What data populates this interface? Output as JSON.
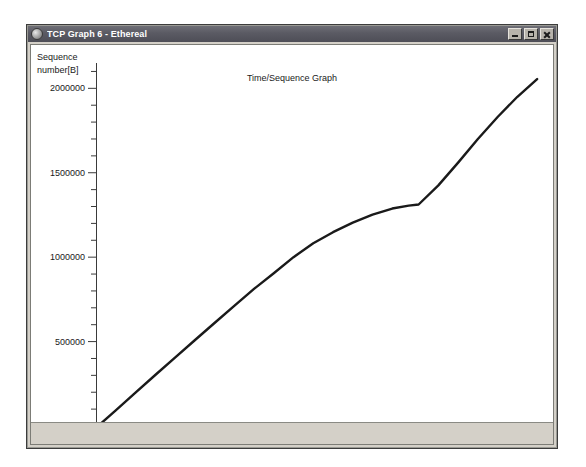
{
  "window": {
    "title": "TCP Graph 6 - Ethereal",
    "icon": "app-globe-icon",
    "buttons": {
      "minimize": "Minimize",
      "maximize": "Maximize",
      "close": "Close"
    }
  },
  "chart_data": {
    "type": "line",
    "title": "Time/Sequence Graph",
    "xlabel": "",
    "ylabel": "Sequence number[B]",
    "ylabel_line1": "Sequence",
    "ylabel_line2": "number[B]",
    "xlim": [
      0,
      6.85
    ],
    "ylim": [
      0,
      2150000
    ],
    "grid": false,
    "legend": "none",
    "xticks": [
      0.5,
      1.0,
      1.5,
      2.0,
      2.5,
      3.0,
      3.5,
      4.0,
      4.5,
      5.0,
      5.5,
      6.0,
      6.5
    ],
    "xticklabels": [
      "0.5",
      "1.0",
      "1.5",
      "2.0",
      "2.5",
      "3.0",
      "3.5",
      "4.0",
      "4.5",
      "5.0",
      "5.5",
      "6.0",
      "6.5"
    ],
    "xtick_minor_step": 0.1,
    "yticks": [
      500000,
      1000000,
      1500000,
      2000000
    ],
    "yticklabels": [
      "500000",
      "1000000",
      "1500000",
      "2000000"
    ],
    "ytick_minor_step": 100000,
    "series": [
      {
        "name": "tcp-sequence",
        "color": "#1a1a1a",
        "x": [
          0.06,
          0.3,
          0.6,
          0.9,
          1.2,
          1.5,
          1.8,
          2.1,
          2.4,
          2.7,
          3.0,
          3.3,
          3.6,
          3.9,
          4.2,
          4.5,
          4.75,
          4.9,
          5.2,
          5.5,
          5.8,
          6.1,
          6.4,
          6.7
        ],
        "y": [
          10000,
          92000,
          198000,
          302000,
          405000,
          508000,
          610000,
          712000,
          812000,
          905000,
          1000000,
          1082000,
          1148000,
          1205000,
          1252000,
          1288000,
          1305000,
          1312000,
          1425000,
          1560000,
          1700000,
          1830000,
          1950000,
          2055000
        ]
      }
    ]
  }
}
